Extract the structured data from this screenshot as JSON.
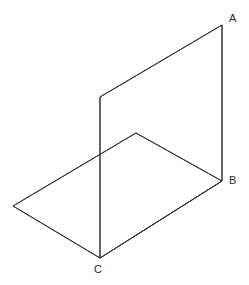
{
  "figure": {
    "background_color": "#ffffff",
    "stroke_color": "#333333",
    "stroke_width": 1,
    "canvas": {
      "width": 249,
      "height": 285
    }
  },
  "geometry": {
    "vertical_plane": {
      "name": "vertical-plane",
      "points": "222,25 100,97 100,258 222,181",
      "vertices": [
        {
          "id": "A",
          "x": 222,
          "y": 25
        },
        {
          "id": "V1",
          "x": 100,
          "y": 97
        },
        {
          "id": "C",
          "x": 100,
          "y": 258
        },
        {
          "id": "B",
          "x": 222,
          "y": 181
        }
      ]
    },
    "horizontal_plane": {
      "name": "horizontal-plane",
      "points": "136,133 222,181 100,258 13,206",
      "vertices": [
        {
          "id": "H_far",
          "x": 136,
          "y": 133
        },
        {
          "id": "B",
          "x": 222,
          "y": 181
        },
        {
          "id": "C",
          "x": 100,
          "y": 258
        },
        {
          "id": "H_left",
          "x": 13,
          "y": 206
        }
      ]
    },
    "edges": [
      {
        "name": "edge-A-to-upper-left",
        "x1": 222,
        "y1": 25,
        "x2": 100,
        "y2": 97
      },
      {
        "name": "edge-A-to-B",
        "x1": 222,
        "y1": 25,
        "x2": 222,
        "y2": 181
      },
      {
        "name": "edge-upper-left-to-C",
        "x1": 100,
        "y1": 97,
        "x2": 100,
        "y2": 258
      },
      {
        "name": "edge-C-to-B",
        "x1": 100,
        "y1": 258,
        "x2": 222,
        "y2": 181
      },
      {
        "name": "edge-far-to-B",
        "x1": 136,
        "y1": 133,
        "x2": 222,
        "y2": 181
      },
      {
        "name": "edge-far-to-left",
        "x1": 136,
        "y1": 133,
        "x2": 13,
        "y2": 206
      },
      {
        "name": "edge-left-to-C",
        "x1": 13,
        "y1": 206,
        "x2": 100,
        "y2": 258
      }
    ]
  },
  "labels": {
    "a": {
      "text": "A",
      "x": 229,
      "y": 13
    },
    "b": {
      "text": "B",
      "x": 229,
      "y": 175
    },
    "c": {
      "text": "C",
      "x": 94,
      "y": 264
    }
  }
}
